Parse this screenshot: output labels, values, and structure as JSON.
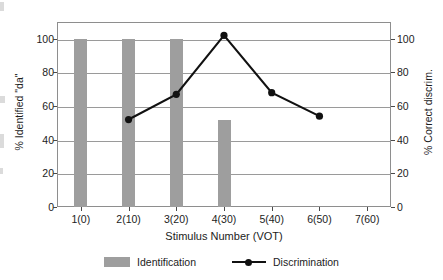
{
  "chart_data": {
    "type": "bar",
    "title": "",
    "subtitle": "",
    "xlabel": "Stimulus Number (VOT)",
    "ylabel": "% Identified \"da\"",
    "ylabel_secondary": "% Correct discrim.",
    "categories": [
      "1(0)",
      "2(10)",
      "3(20)",
      "4(30)",
      "5(40)",
      "6(50)",
      "7(60)"
    ],
    "ylim": [
      0,
      110
    ],
    "ylim_secondary": [
      0,
      110
    ],
    "yticks": [
      0,
      20,
      40,
      60,
      80,
      100
    ],
    "yticks_secondary": [
      0,
      20,
      40,
      60,
      80,
      100
    ],
    "ytick_labels": [
      "0",
      "20",
      "40",
      "60",
      "80",
      "100"
    ],
    "ytick_labels_secondary": [
      "0",
      "20",
      "40",
      "60",
      "80",
      "100"
    ],
    "grid": "horizontal",
    "legend_position": "below",
    "series": [
      {
        "name": "Identification",
        "type": "bar",
        "axis": "left",
        "color": "#9e9e9e",
        "categories": [
          "1(0)",
          "2(10)",
          "3(20)",
          "4(30)",
          "5(40)",
          "6(50)",
          "7(60)"
        ],
        "values": [
          100,
          100,
          100,
          52,
          null,
          null,
          null
        ]
      },
      {
        "name": "Discrimination",
        "type": "line",
        "axis": "right",
        "color": "#111111",
        "marker": "filled-circle",
        "categories": [
          "1(0)",
          "2(10)",
          "3(20)",
          "4(30)",
          "5(40)",
          "6(50)",
          "7(60)"
        ],
        "values": [
          null,
          52,
          67,
          102,
          68,
          54,
          null
        ]
      }
    ]
  },
  "axes": {
    "left": {
      "title": "% Identified \"da\"",
      "ticks": [
        {
          "value": 100,
          "label": "100"
        },
        {
          "value": 80,
          "label": "80"
        },
        {
          "value": 60,
          "label": "60"
        },
        {
          "value": 40,
          "label": "40"
        },
        {
          "value": 20,
          "label": "20"
        },
        {
          "value": 0,
          "label": "0"
        }
      ]
    },
    "right": {
      "title": "% Correct discrim.",
      "ticks": [
        {
          "value": 100,
          "label": "100"
        },
        {
          "value": 80,
          "label": "80"
        },
        {
          "value": 60,
          "label": "60"
        },
        {
          "value": 40,
          "label": "40"
        },
        {
          "value": 20,
          "label": "20"
        },
        {
          "value": 0,
          "label": "0"
        }
      ]
    },
    "x": {
      "title": "Stimulus Number (VOT)",
      "ticks": [
        {
          "label": "1(0)"
        },
        {
          "label": "2(10)"
        },
        {
          "label": "3(20)"
        },
        {
          "label": "4(30)"
        },
        {
          "label": "5(40)"
        },
        {
          "label": "6(50)"
        },
        {
          "label": "7(60)"
        }
      ]
    }
  },
  "legend": {
    "items": [
      {
        "label": "Identification",
        "marker": "bar-swatch",
        "color": "#9e9e9e"
      },
      {
        "label": "Discrimination",
        "marker": "line-marker",
        "color": "#111111"
      }
    ]
  },
  "style": {
    "bar_color": "#9e9e9e",
    "line_color": "#111111",
    "gridline_color": "#9a9a9a",
    "frame_color": "#8e8e8e",
    "background": "#ffffff"
  }
}
